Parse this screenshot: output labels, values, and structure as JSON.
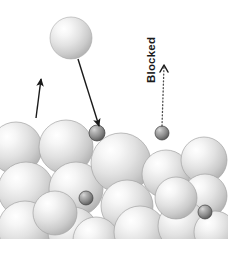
{
  "figure": {
    "background_color": "#ffffff",
    "width": 228,
    "height": 263,
    "annotations": {
      "blocked_label": "Blocked"
    },
    "colors": {
      "large_sphere_light": "#fdfdfd",
      "large_sphere_mid": "#d2d2d2",
      "large_sphere_edge": "#9a9a9a",
      "small_sphere_light": "#c9c9c9",
      "small_sphere_mid": "#8a8a8a",
      "small_sphere_edge": "#4d4d4d",
      "arrow_stroke": "#1a1a1a",
      "dotted_stroke": "#4d4d4d",
      "label_text": "#1a1a1a"
    }
  },
  "elements": {
    "flying_sphere": {
      "cx": 71,
      "cy": 38,
      "r": 21
    },
    "large_spheres": [
      {
        "cx": 16,
        "cy": 148,
        "r": 26
      },
      {
        "cx": 66,
        "cy": 147,
        "r": 27
      },
      {
        "cx": 26,
        "cy": 190,
        "r": 28
      },
      {
        "cx": 76,
        "cy": 189,
        "r": 27
      },
      {
        "cx": 121,
        "cy": 163,
        "r": 30
      },
      {
        "cx": 127,
        "cy": 206,
        "r": 26
      },
      {
        "cx": 166,
        "cy": 174,
        "r": 24
      },
      {
        "cx": 204,
        "cy": 160,
        "r": 23
      },
      {
        "cx": 205,
        "cy": 196,
        "r": 22
      },
      {
        "cx": 25,
        "cy": 228,
        "r": 27
      },
      {
        "cx": 73,
        "cy": 232,
        "r": 25
      },
      {
        "cx": 96,
        "cy": 240,
        "r": 23
      },
      {
        "cx": 140,
        "cy": 232,
        "r": 26
      },
      {
        "cx": 183,
        "cy": 226,
        "r": 25
      },
      {
        "cx": 176,
        "cy": 198,
        "r": 21
      },
      {
        "cx": 55,
        "cy": 213,
        "r": 22
      },
      {
        "cx": 215,
        "cy": 232,
        "r": 21
      }
    ],
    "small_spheres": [
      {
        "cx": 97,
        "cy": 133,
        "r": 8,
        "name": "deposited-particle-left"
      },
      {
        "cx": 162,
        "cy": 133,
        "r": 7,
        "name": "blocked-particle"
      },
      {
        "cx": 86,
        "cy": 198,
        "r": 7,
        "name": "trapped-particle-mid"
      },
      {
        "cx": 205,
        "cy": 212,
        "r": 7,
        "name": "trapped-particle-right"
      }
    ],
    "incoming_trajectory": {
      "x1": 78,
      "y1": 59,
      "x2": 99,
      "y2": 126,
      "arrowhead": true
    },
    "rebound_arrow": {
      "x1": 36,
      "y1": 118,
      "x2": 41,
      "y2": 79,
      "arrowhead": true
    },
    "blocked_path": {
      "x1": 162,
      "y1": 126,
      "x2": 164,
      "y2": 66,
      "style": "dotted",
      "arrowhead": "chevron"
    }
  }
}
